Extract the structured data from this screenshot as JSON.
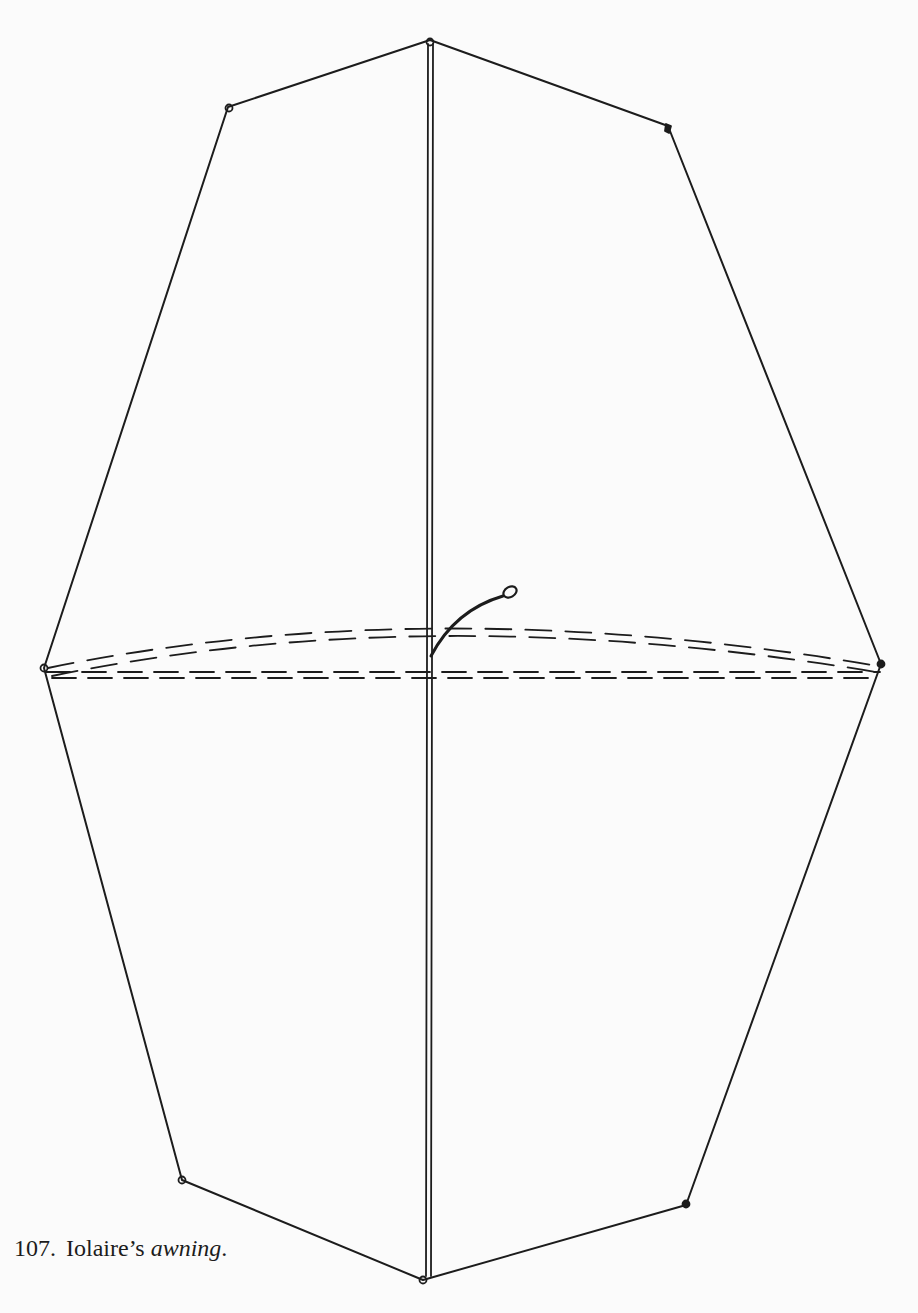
{
  "figure": {
    "number": "107.",
    "title_plain": "Iolaire’s",
    "title_italic": "awning",
    "title_end": ".",
    "colors": {
      "background": "#fbfbfb",
      "ink": "#1c1c1c"
    },
    "vertices": {
      "top": [
        430,
        40
      ],
      "upper_left": [
        228,
        107
      ],
      "upper_right": [
        668,
        126
      ],
      "left": [
        44,
        668
      ],
      "right": [
        881,
        664
      ],
      "lower_left": [
        182,
        1180
      ],
      "lower_right": [
        686,
        1205
      ],
      "bottom": [
        423,
        1280
      ]
    }
  }
}
